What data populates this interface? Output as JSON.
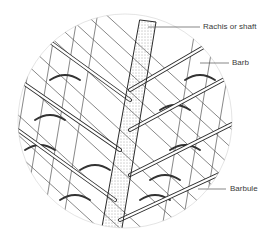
{
  "figure": {
    "labels": [
      {
        "id": "rachis",
        "text": "Rachis or shaft",
        "x": 203,
        "y": 22,
        "line_from": [
          148,
          27
        ],
        "line_to": [
          200,
          27
        ]
      },
      {
        "id": "barb",
        "text": "Barb",
        "x": 232,
        "y": 58,
        "line_from": [
          200,
          63
        ],
        "line_to": [
          229,
          63
        ]
      },
      {
        "id": "barbule",
        "text": "Barbule",
        "x": 230,
        "y": 184,
        "line_from": [
          198,
          189
        ],
        "line_to": [
          226,
          189
        ]
      }
    ],
    "colors": {
      "ink": "#2b2b2b",
      "label": "#3a3a3a",
      "leader": "#555555",
      "background": "#ffffff"
    }
  }
}
